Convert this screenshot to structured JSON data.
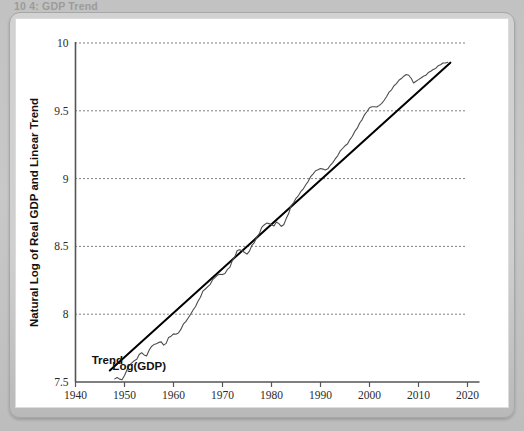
{
  "caption": {
    "text": "10 4: GDP Trend"
  },
  "chart_data": {
    "type": "line",
    "title": "",
    "xlabel": "Year",
    "ylabel": "Natural Log of Real GDP and Linear Trend",
    "xlim": [
      1940,
      2020
    ],
    "ylim": [
      7.5,
      10
    ],
    "xticks": [
      1940,
      1950,
      1960,
      1970,
      1980,
      1990,
      2000,
      2010,
      2020
    ],
    "yticks": [
      7.5,
      8,
      8.5,
      9,
      9.5,
      10
    ],
    "xtick_labels": [
      "1940",
      "1950",
      "1960",
      "1970",
      "1980",
      "1990",
      "2000",
      "2010",
      "2020"
    ],
    "ytick_labels": [
      "7.5",
      "8",
      "8.5",
      "9",
      "9.5",
      "10"
    ],
    "grid": "horizontal-dotted",
    "legend": "inline-annotations",
    "colors": {
      "trend_line": "#000000",
      "gdp_line": "#4d4d4d",
      "grid": "#000000",
      "axis": "#555555",
      "plot_background": "#ffffff"
    },
    "annotations": [
      {
        "name": "trend-label",
        "text": "Trend",
        "x": 1946.5,
        "y": 7.63
      },
      {
        "name": "loggdp-label",
        "text": "Log(GDP)",
        "x": 1953.0,
        "y": 7.585
      }
    ],
    "series": [
      {
        "name": "Trend",
        "type": "line",
        "x": [
          1947.0,
          2016.5
        ],
        "values": [
          7.585,
          9.855
        ]
      },
      {
        "name": "Log(GDP)",
        "type": "line",
        "x": [
          1948.0,
          1948.5,
          1949.0,
          1949.5,
          1950.0,
          1950.5,
          1951.0,
          1951.5,
          1952.0,
          1952.5,
          1953.0,
          1953.5,
          1954.0,
          1954.5,
          1955.0,
          1955.5,
          1956.0,
          1956.5,
          1957.0,
          1957.5,
          1958.0,
          1958.5,
          1959.0,
          1959.5,
          1960.0,
          1960.5,
          1961.0,
          1961.5,
          1962.0,
          1962.5,
          1963.0,
          1963.5,
          1964.0,
          1964.5,
          1965.0,
          1965.5,
          1966.0,
          1966.5,
          1967.0,
          1967.5,
          1968.0,
          1968.5,
          1969.0,
          1969.5,
          1970.0,
          1970.5,
          1971.0,
          1971.5,
          1972.0,
          1972.5,
          1973.0,
          1973.5,
          1974.0,
          1974.5,
          1975.0,
          1975.5,
          1976.0,
          1976.5,
          1977.0,
          1977.5,
          1978.0,
          1978.5,
          1979.0,
          1979.5,
          1980.0,
          1980.5,
          1981.0,
          1981.5,
          1982.0,
          1982.5,
          1983.0,
          1983.5,
          1984.0,
          1984.5,
          1985.0,
          1985.5,
          1986.0,
          1986.5,
          1987.0,
          1987.5,
          1988.0,
          1988.5,
          1989.0,
          1989.5,
          1990.0,
          1990.5,
          1991.0,
          1991.5,
          1992.0,
          1992.5,
          1993.0,
          1993.5,
          1994.0,
          1994.5,
          1995.0,
          1995.5,
          1996.0,
          1996.5,
          1997.0,
          1997.5,
          1998.0,
          1998.5,
          1999.0,
          1999.5,
          2000.0,
          2000.5,
          2001.0,
          2001.5,
          2002.0,
          2002.5,
          2003.0,
          2003.5,
          2004.0,
          2004.5,
          2005.0,
          2005.5,
          2006.0,
          2006.5,
          2007.0,
          2007.5,
          2008.0,
          2008.5,
          2009.0,
          2009.5,
          2010.0,
          2010.5,
          2011.0,
          2011.5,
          2012.0,
          2012.5,
          2013.0,
          2013.5,
          2014.0,
          2014.5,
          2015.0,
          2015.5,
          2016.0
        ],
        "values": [
          7.523,
          7.533,
          7.521,
          7.517,
          7.548,
          7.588,
          7.625,
          7.641,
          7.657,
          7.667,
          7.703,
          7.716,
          7.7,
          7.692,
          7.733,
          7.762,
          7.776,
          7.782,
          7.792,
          7.796,
          7.772,
          7.785,
          7.829,
          7.838,
          7.855,
          7.852,
          7.861,
          7.888,
          7.926,
          7.945,
          7.972,
          8.0,
          8.031,
          8.057,
          8.095,
          8.125,
          8.17,
          8.186,
          8.203,
          8.22,
          8.255,
          8.272,
          8.289,
          8.295,
          8.292,
          8.3,
          8.33,
          8.345,
          8.395,
          8.42,
          8.47,
          8.475,
          8.468,
          8.455,
          8.443,
          8.465,
          8.508,
          8.528,
          8.57,
          8.592,
          8.64,
          8.658,
          8.672,
          8.668,
          8.66,
          8.65,
          8.68,
          8.668,
          8.648,
          8.66,
          8.705,
          8.742,
          8.8,
          8.822,
          8.855,
          8.875,
          8.905,
          8.925,
          8.955,
          8.98,
          9.015,
          9.035,
          9.058,
          9.065,
          9.075,
          9.07,
          9.063,
          9.072,
          9.098,
          9.118,
          9.145,
          9.168,
          9.202,
          9.222,
          9.242,
          9.255,
          9.288,
          9.312,
          9.348,
          9.372,
          9.41,
          9.435,
          9.472,
          9.495,
          9.522,
          9.53,
          9.53,
          9.528,
          9.54,
          9.555,
          9.578,
          9.605,
          9.638,
          9.655,
          9.685,
          9.7,
          9.725,
          9.738,
          9.755,
          9.768,
          9.762,
          9.74,
          9.705,
          9.718,
          9.73,
          9.742,
          9.755,
          9.762,
          9.782,
          9.792,
          9.805,
          9.812,
          9.832,
          9.84,
          9.852,
          9.852,
          9.858
        ]
      }
    ]
  }
}
